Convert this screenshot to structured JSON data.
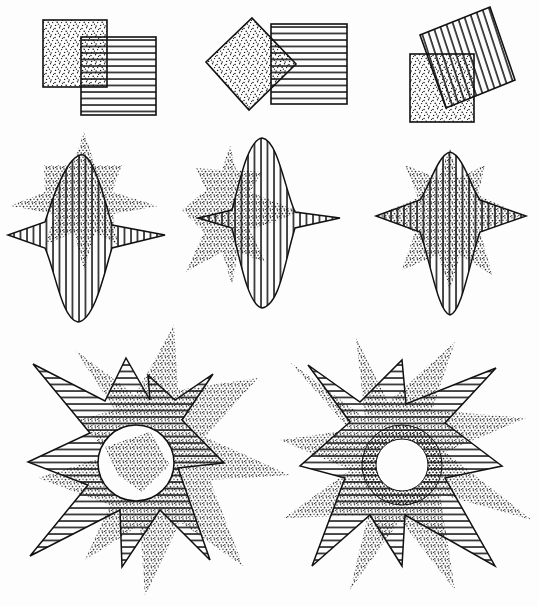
{
  "figure": {
    "ink_color": "#111111",
    "paper_color": "#fdfdfd",
    "row1": [
      {
        "name": "offset-squares",
        "stipple": "square",
        "hatch": "square-horizontal"
      },
      {
        "name": "diamond-and-square",
        "stipple": "diamond",
        "hatch": "square-horizontal"
      },
      {
        "name": "rotated-squares",
        "stipple": "square",
        "hatch": "rotated-square-vertical"
      }
    ],
    "row2": [
      {
        "name": "four-point-star-left",
        "stipple": "six-point-star",
        "hatch": "four-point-star-vertical"
      },
      {
        "name": "four-point-star-middle",
        "stipple": "six-point-star",
        "hatch": "four-point-star-vertical"
      },
      {
        "name": "four-point-star-right",
        "stipple": "six-point-star",
        "hatch": "four-point-star-vertical"
      }
    ],
    "row3": [
      {
        "name": "sunburst-left",
        "stipple": "eight-point-star",
        "hatch": "eight-point-star-horizontal",
        "center": "circle"
      },
      {
        "name": "sunburst-right",
        "stipple": "eight-point-star",
        "hatch": "eight-point-star-horizontal",
        "center": "circle-ring"
      }
    ]
  }
}
